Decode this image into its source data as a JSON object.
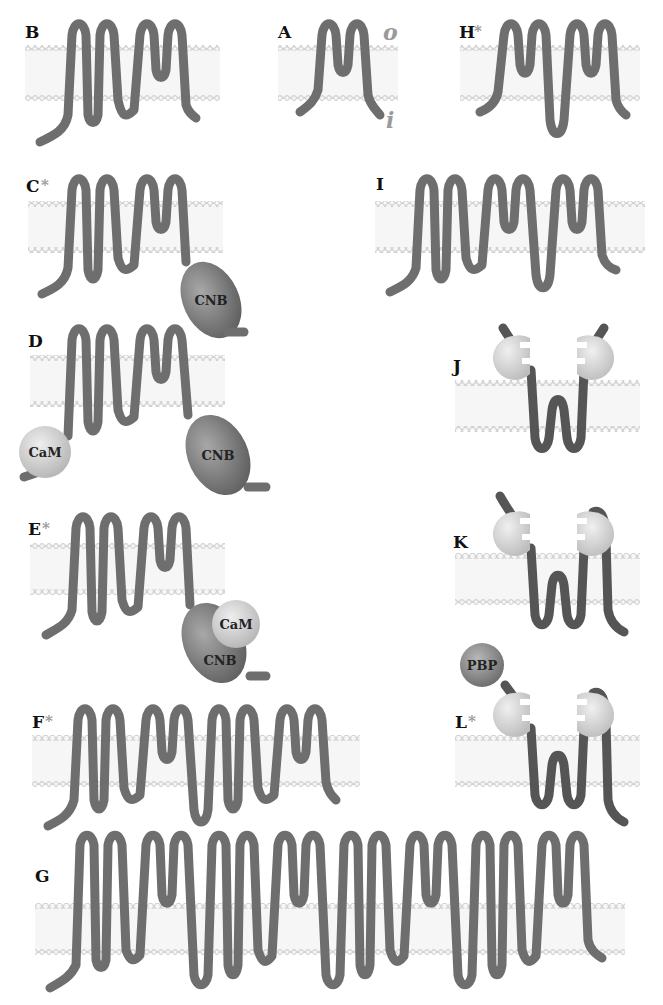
{
  "figure": {
    "colors": {
      "chain": "#6e6e6e",
      "membrane_dots": "#d6d6d6",
      "membrane_fill": "#f4f4f4",
      "cnb": "#7d7d7d",
      "cam": "#cfcfcf",
      "pbp": "#8a8a8a",
      "pore_domain": "#d9d9d9",
      "label": "#111111",
      "asterisk": "#9a9a9a"
    },
    "side_labels": {
      "outside": "o",
      "inside": "i"
    },
    "panels": [
      {
        "id": "A",
        "label": "A",
        "starred": false,
        "tm_segments": 2,
        "extra_domains": []
      },
      {
        "id": "B",
        "label": "B",
        "starred": false,
        "tm_segments": 6,
        "extra_domains": []
      },
      {
        "id": "H",
        "label": "H",
        "starred": true,
        "tm_segments": 4,
        "extra_domains": []
      },
      {
        "id": "C",
        "label": "C",
        "starred": true,
        "tm_segments": 6,
        "extra_domains": [
          "CNB"
        ]
      },
      {
        "id": "I",
        "label": "I",
        "starred": false,
        "tm_segments": 8,
        "extra_domains": []
      },
      {
        "id": "D",
        "label": "D",
        "starred": false,
        "tm_segments": 6,
        "extra_domains": [
          "CaM",
          "CNB"
        ]
      },
      {
        "id": "J",
        "label": "J",
        "starred": false,
        "tm_segments": 2,
        "extra_domains": [
          "pore-binding domains"
        ]
      },
      {
        "id": "E",
        "label": "E",
        "starred": true,
        "tm_segments": 6,
        "extra_domains": [
          "CaM",
          "CNB"
        ]
      },
      {
        "id": "K",
        "label": "K",
        "starred": false,
        "tm_segments": 3,
        "extra_domains": [
          "pore-binding domains"
        ]
      },
      {
        "id": "F",
        "label": "F",
        "starred": true,
        "tm_segments": 12,
        "extra_domains": []
      },
      {
        "id": "L",
        "label": "L",
        "starred": true,
        "tm_segments": 3,
        "extra_domains": [
          "PBP",
          "pore-binding domains"
        ]
      },
      {
        "id": "G",
        "label": "G",
        "starred": false,
        "tm_segments": 24,
        "extra_domains": []
      }
    ],
    "domain_labels": {
      "cnb": "CNB",
      "cam": "CaM",
      "pbp": "PBP"
    },
    "asterisk": "*"
  }
}
